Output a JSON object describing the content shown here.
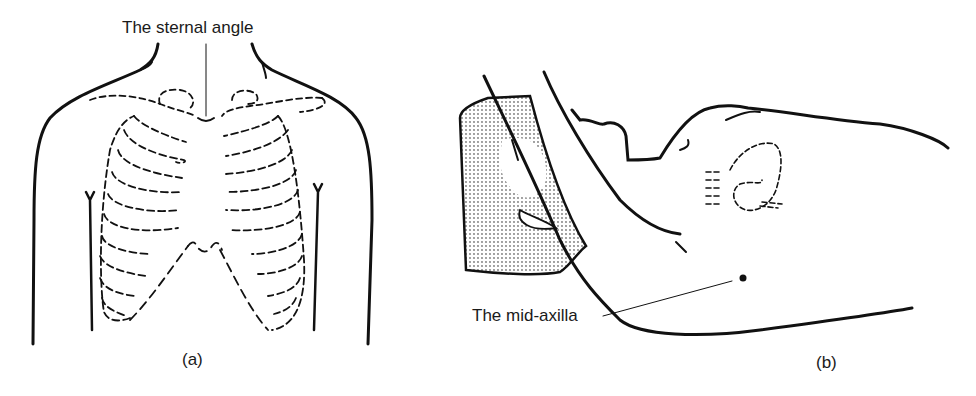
{
  "figure": {
    "panels": [
      {
        "id": "a",
        "caption": "(a)",
        "subject": "anterior chest with rib cage outline",
        "annotations": [
          {
            "label": "The sternal angle"
          }
        ]
      },
      {
        "id": "b",
        "caption": "(b)",
        "subject": "patient lying with arm raised, lateral chest view",
        "annotations": [
          {
            "label": "The mid-axilla"
          }
        ]
      }
    ],
    "colors": {
      "line": "#111111",
      "shading": "#9a9a9a",
      "background": "#ffffff"
    }
  }
}
